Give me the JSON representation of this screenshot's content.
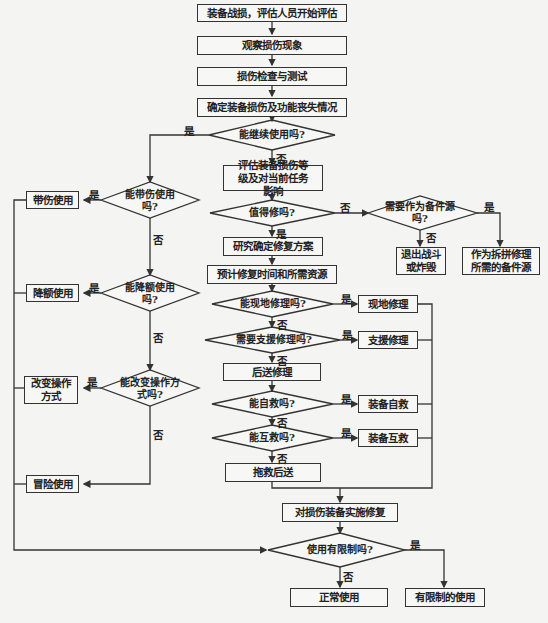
{
  "nodes": {
    "start": "装备战损，评估人员开始评估",
    "observe": "观察损伤现象",
    "inspect": "损伤检查与测试",
    "determine": "确定装备损伤及功能丧失情况",
    "can_continue": "能继续使用吗?",
    "assess": "评估装备损伤等级及对当前任务影响",
    "worth_repair": "值得修吗?",
    "need_spare": "需要作为备件源吗?",
    "retire": "退出战斗或炸毁",
    "spare_source": "作为拆拼修理所需的备件源",
    "study_plan": "研究确定修复方案",
    "estimate": "预计修复时间和所需资源",
    "field_repair_q": "能现地修理吗?",
    "field_repair": "现地修理",
    "support_repair_q": "需要支援修理吗?",
    "support_repair": "支援修理",
    "rear_repair": "后送修理",
    "self_rescue_q": "能自救吗?",
    "self_rescue": "装备自救",
    "mutual_rescue_q": "能互救吗?",
    "mutual_rescue": "装备互救",
    "tow_back": "拖救后送",
    "implement": "对损伤装备实施修复",
    "restricted_q": "使用有限制吗?",
    "normal_use": "正常使用",
    "restricted_use": "有限制的使用",
    "damaged_use_q": "能带伤使用吗?",
    "damaged_use": "带伤使用",
    "derated_q": "能降额使用吗?",
    "derated_use": "降额使用",
    "change_op_q": "能改变操作方式吗?",
    "change_op": "改变操作方式",
    "risk_use": "冒险使用"
  },
  "labels": {
    "yes": "是",
    "no": "否"
  },
  "colors": {
    "line": "#333333",
    "background": "#f4f4f2"
  }
}
